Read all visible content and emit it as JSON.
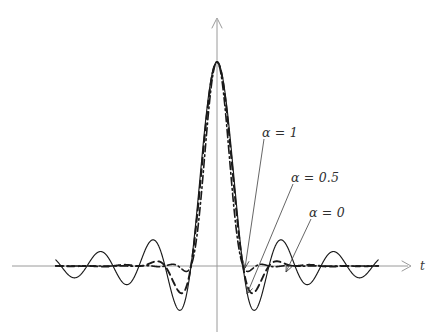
{
  "chart_data": {
    "type": "line",
    "title": "",
    "subtitle": "",
    "xlabel": "t",
    "ylabel": "",
    "grid": false,
    "legend_position": "inline-annotations",
    "x": [
      -6,
      -5.5,
      -5,
      -4.5,
      -4,
      -3.5,
      -3,
      -2.5,
      -2,
      -1.5,
      -1,
      -0.5,
      0,
      0.5,
      1,
      1.5,
      2,
      2.5,
      3,
      3.5,
      4,
      4.5,
      5,
      5.5,
      6
    ],
    "xlim": [
      -6.2,
      6.2
    ],
    "ylim": [
      -0.31,
      1.08
    ],
    "series": [
      {
        "name": "alpha-0",
        "label": "α = 0",
        "rolloff": 0,
        "style": "solid",
        "values": [
          0,
          -0.1273,
          0,
          0.1415,
          0,
          -0.1819,
          0,
          0.2546,
          0,
          -0.4244,
          0,
          0.6366,
          1,
          0.6366,
          0,
          -0.4244,
          0,
          0.2546,
          0,
          -0.1819,
          0,
          0.1415,
          0,
          -0.1273,
          0
        ]
      },
      {
        "name": "alpha-0-5",
        "label": "α = 0.5",
        "rolloff": 0.5,
        "style": "dashed",
        "values": [
          0,
          0.0,
          0,
          -0.0077,
          0,
          0.0189,
          0,
          -0.0424,
          0,
          -0.0966,
          0,
          0.5901,
          1,
          0.5901,
          0,
          -0.0966,
          0,
          -0.0424,
          0,
          0.0189,
          0,
          -0.0077,
          0,
          0.0,
          0
        ]
      },
      {
        "name": "alpha-1",
        "label": "α = 1",
        "rolloff": 1,
        "style": "dashdot",
        "values": [
          0,
          0,
          0,
          0,
          0,
          0,
          0,
          0,
          0,
          0,
          0,
          0.5,
          1,
          0.5,
          0,
          0,
          0,
          0,
          0,
          0,
          0,
          0,
          0,
          0,
          0
        ]
      }
    ],
    "annotations": [
      {
        "name": "alpha-1",
        "text": "α = 1",
        "label_x": 262,
        "label_y": 125,
        "target_x": 245,
        "target_y": 268
      },
      {
        "name": "alpha-0-5",
        "text": "α = 0.5",
        "label_x": 291,
        "label_y": 170,
        "target_x": 247,
        "target_y": 294
      },
      {
        "name": "alpha-0",
        "text": "α = 0",
        "label_x": 309,
        "label_y": 205,
        "target_x": 286,
        "target_y": 272
      }
    ],
    "axes": {
      "x_axis_label": "t",
      "x_axis_label_x": 420,
      "x_axis_label_y": 259,
      "origin_x": 217,
      "baseline_y": 266,
      "peak_y": 62,
      "axis_color": "#9a9a9a",
      "curve_color": "#1a1a1a"
    }
  }
}
